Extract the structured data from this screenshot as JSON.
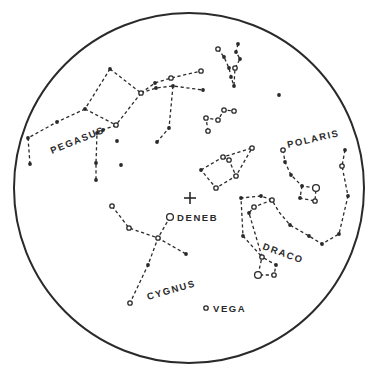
{
  "chart": {
    "colors": {
      "ink": "#2a2a2a",
      "background": "#ffffff"
    },
    "horizon": {
      "cx": 189,
      "cy": 188,
      "r": 175
    },
    "zenith_marker": {
      "x": 190,
      "y": 198,
      "symbol": "+"
    },
    "labels": [
      {
        "id": "pegasus",
        "text": "PEGASUS",
        "x": 52,
        "y": 154,
        "rotate": -22
      },
      {
        "id": "polaris",
        "text": "POLARIS",
        "x": 288,
        "y": 148,
        "rotate": -13
      },
      {
        "id": "deneb",
        "text": "DENEB",
        "x": 177,
        "y": 221,
        "rotate": 0
      },
      {
        "id": "cygnus",
        "text": "CYGNUS",
        "x": 148,
        "y": 300,
        "rotate": -16
      },
      {
        "id": "draco",
        "text": "DRACO",
        "x": 262,
        "y": 249,
        "rotate": 20
      },
      {
        "id": "vega",
        "text": "VEGA",
        "x": 213,
        "y": 312,
        "rotate": 0
      }
    ],
    "constellations": [
      {
        "name": "Pegasus",
        "lines": [
          [
            [
              110,
              69
            ],
            [
              141,
              93
            ]
          ],
          [
            [
              110,
              69
            ],
            [
              85,
              109
            ]
          ],
          [
            [
              141,
              93
            ],
            [
              116,
              125
            ]
          ],
          [
            [
              85,
              109
            ],
            [
              116,
              125
            ]
          ],
          [
            [
              85,
              109
            ],
            [
              57,
              122
            ],
            [
              28,
              138
            ],
            [
              30,
              164
            ]
          ],
          [
            [
              116,
              125
            ],
            [
              103,
              130
            ],
            [
              97,
              133
            ],
            [
              96,
              163
            ],
            [
              96,
              180
            ]
          ]
        ],
        "stars": [
          {
            "x": 110,
            "y": 69,
            "t": "f"
          },
          {
            "x": 141,
            "y": 93,
            "t": "o"
          },
          {
            "x": 116,
            "y": 125,
            "t": "o"
          },
          {
            "x": 85,
            "y": 109,
            "t": "f"
          },
          {
            "x": 57,
            "y": 122,
            "t": "f"
          },
          {
            "x": 28,
            "y": 138,
            "t": "f"
          },
          {
            "x": 30,
            "y": 164,
            "t": "f"
          },
          {
            "x": 103,
            "y": 130,
            "t": "f"
          },
          {
            "x": 97,
            "y": 133,
            "t": "f"
          },
          {
            "x": 96,
            "y": 163,
            "t": "f"
          },
          {
            "x": 96,
            "y": 180,
            "t": "f"
          },
          {
            "x": 117,
            "y": 141,
            "t": "f"
          },
          {
            "x": 121,
            "y": 165,
            "t": "f"
          }
        ]
      },
      {
        "name": "Andromeda",
        "lines": [
          [
            [
              141,
              93
            ],
            [
              155,
              83
            ],
            [
              171,
              78
            ],
            [
              201,
              71
            ]
          ],
          [
            [
              141,
              93
            ],
            [
              156,
              88
            ],
            [
              173,
              86
            ],
            [
              203,
              90
            ]
          ],
          [
            [
              173,
              86
            ],
            [
              169,
              128
            ],
            [
              157,
              142
            ]
          ]
        ],
        "stars": [
          {
            "x": 155,
            "y": 83,
            "t": "f"
          },
          {
            "x": 171,
            "y": 78,
            "t": "o"
          },
          {
            "x": 201,
            "y": 71,
            "t": "o"
          },
          {
            "x": 156,
            "y": 88,
            "t": "f"
          },
          {
            "x": 173,
            "y": 86,
            "t": "f"
          },
          {
            "x": 203,
            "y": 90,
            "t": "f"
          },
          {
            "x": 169,
            "y": 128,
            "t": "f"
          },
          {
            "x": 157,
            "y": 142,
            "t": "f"
          }
        ]
      },
      {
        "name": "Perseus",
        "lines": [
          [
            [
              218,
              49
            ],
            [
              224,
              57
            ],
            [
              229,
              68
            ],
            [
              231,
              77
            ],
            [
              234,
              86
            ]
          ],
          [
            [
              238,
              44
            ],
            [
              236,
              52
            ],
            [
              240,
              59
            ],
            [
              235,
              68
            ],
            [
              234,
              86
            ]
          ]
        ],
        "stars": [
          {
            "x": 218,
            "y": 49,
            "t": "o"
          },
          {
            "x": 224,
            "y": 57,
            "t": "f"
          },
          {
            "x": 229,
            "y": 68,
            "t": "f"
          },
          {
            "x": 231,
            "y": 77,
            "t": "f"
          },
          {
            "x": 234,
            "y": 86,
            "t": "f"
          },
          {
            "x": 238,
            "y": 44,
            "t": "f"
          },
          {
            "x": 236,
            "y": 52,
            "t": "f"
          },
          {
            "x": 240,
            "y": 59,
            "t": "f"
          },
          {
            "x": 235,
            "y": 68,
            "t": "o"
          }
        ]
      },
      {
        "name": "Auriga",
        "lines": [
          [
            [
              208,
              131
            ],
            [
              206,
              118
            ],
            [
              218,
              120
            ],
            [
              224,
              110
            ],
            [
              234,
              111
            ]
          ]
        ],
        "stars": [
          {
            "x": 206,
            "y": 118,
            "t": "o"
          },
          {
            "x": 218,
            "y": 120,
            "t": "o"
          },
          {
            "x": 224,
            "y": 110,
            "t": "o"
          },
          {
            "x": 234,
            "y": 111,
            "t": "o"
          },
          {
            "x": 208,
            "y": 131,
            "t": "o"
          },
          {
            "x": 279,
            "y": 95,
            "t": "f"
          }
        ]
      },
      {
        "name": "Cepheus",
        "lines": [
          [
            [
              201,
              170
            ],
            [
              223,
              157
            ],
            [
              252,
              148
            ],
            [
              236,
              176
            ],
            [
              216,
              188
            ],
            [
              201,
              170
            ]
          ],
          [
            [
              223,
              157
            ],
            [
              229,
              160
            ],
            [
              236,
              176
            ]
          ]
        ],
        "stars": [
          {
            "x": 201,
            "y": 170,
            "t": "f"
          },
          {
            "x": 223,
            "y": 157,
            "t": "o"
          },
          {
            "x": 252,
            "y": 148,
            "t": "o"
          },
          {
            "x": 236,
            "y": 176,
            "t": "o"
          },
          {
            "x": 216,
            "y": 188,
            "t": "o"
          },
          {
            "x": 229,
            "y": 160,
            "t": "o"
          }
        ]
      },
      {
        "name": "Cygnus",
        "lines": [
          [
            [
              170,
              217
            ],
            [
              158,
              238
            ],
            [
              148,
              265
            ],
            [
              130,
              303
            ]
          ],
          [
            [
              112,
              206
            ],
            [
              129,
              228
            ],
            [
              158,
              238
            ],
            [
              186,
              254
            ]
          ]
        ],
        "stars": [
          {
            "x": 170,
            "y": 217,
            "t": "o",
            "big": true
          },
          {
            "x": 158,
            "y": 238,
            "t": "o"
          },
          {
            "x": 148,
            "y": 265,
            "t": "f"
          },
          {
            "x": 130,
            "y": 303,
            "t": "o"
          },
          {
            "x": 112,
            "y": 206,
            "t": "o"
          },
          {
            "x": 129,
            "y": 228,
            "t": "o"
          },
          {
            "x": 186,
            "y": 254,
            "t": "f"
          }
        ]
      },
      {
        "name": "Ursa Minor",
        "lines": [
          [
            [
              283,
              150
            ],
            [
              285,
              162
            ],
            [
              291,
              175
            ],
            [
              302,
              186
            ],
            [
              316,
              188
            ]
          ],
          [
            [
              302,
              186
            ],
            [
              300,
              198
            ],
            [
              315,
              201
            ],
            [
              316,
              188
            ]
          ]
        ],
        "stars": [
          {
            "x": 283,
            "y": 150,
            "t": "o"
          },
          {
            "x": 285,
            "y": 162,
            "t": "f"
          },
          {
            "x": 291,
            "y": 175,
            "t": "f"
          },
          {
            "x": 302,
            "y": 186,
            "t": "f"
          },
          {
            "x": 316,
            "y": 188,
            "t": "o",
            "big": true
          },
          {
            "x": 300,
            "y": 198,
            "t": "f"
          },
          {
            "x": 315,
            "y": 201,
            "t": "o"
          }
        ]
      },
      {
        "name": "Draco",
        "lines": [
          [
            [
              345,
              150
            ],
            [
              342,
              166
            ],
            [
              348,
              196
            ],
            [
              339,
              234
            ],
            [
              322,
              244
            ],
            [
              309,
              236
            ],
            [
              290,
              225
            ],
            [
              279,
              212
            ],
            [
              272,
              200
            ],
            [
              261,
              196
            ],
            [
              241,
              198
            ],
            [
              243,
              236
            ],
            [
              262,
              257
            ]
          ],
          [
            [
              272,
              200
            ],
            [
              254,
              207
            ],
            [
              249,
              213
            ],
            [
              262,
              257
            ],
            [
              276,
              265
            ],
            [
              274,
              275
            ],
            [
              264,
              275
            ],
            [
              258,
              275
            ],
            [
              262,
              257
            ]
          ]
        ],
        "stars": [
          {
            "x": 345,
            "y": 150,
            "t": "f"
          },
          {
            "x": 342,
            "y": 166,
            "t": "o"
          },
          {
            "x": 348,
            "y": 196,
            "t": "f"
          },
          {
            "x": 339,
            "y": 234,
            "t": "f"
          },
          {
            "x": 322,
            "y": 244,
            "t": "f"
          },
          {
            "x": 309,
            "y": 236,
            "t": "f"
          },
          {
            "x": 290,
            "y": 225,
            "t": "f"
          },
          {
            "x": 272,
            "y": 200,
            "t": "o"
          },
          {
            "x": 261,
            "y": 196,
            "t": "f"
          },
          {
            "x": 241,
            "y": 198,
            "t": "f"
          },
          {
            "x": 243,
            "y": 236,
            "t": "f"
          },
          {
            "x": 254,
            "y": 207,
            "t": "o"
          },
          {
            "x": 249,
            "y": 213,
            "t": "f"
          },
          {
            "x": 262,
            "y": 257,
            "t": "o"
          },
          {
            "x": 276,
            "y": 265,
            "t": "f"
          },
          {
            "x": 274,
            "y": 275,
            "t": "o"
          },
          {
            "x": 258,
            "y": 275,
            "t": "o",
            "big": true
          }
        ]
      },
      {
        "name": "Lyra",
        "lines": [],
        "stars": [
          {
            "x": 206,
            "y": 308,
            "t": "o"
          }
        ]
      }
    ]
  }
}
